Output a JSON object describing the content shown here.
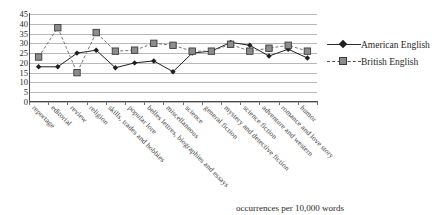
{
  "chart_data": {
    "type": "line",
    "title": "",
    "xlabel": "",
    "ylabel": "",
    "ylim": [
      0,
      45
    ],
    "ytick_values": [
      45,
      40,
      35,
      30,
      25,
      20,
      15,
      10,
      5,
      0
    ],
    "grid": true,
    "legend_position": "right",
    "categories": [
      "reportage",
      "editorial",
      "review",
      "religion",
      "skills, trades and hobbies",
      "popular lore",
      "belles lettres, biographies and essays",
      "miscellaneous",
      "science",
      "general fiction",
      "mystery and detective fiction",
      "science fiction",
      "adventure and western",
      "romance and love story",
      "humor"
    ],
    "series": [
      {
        "name": "American English",
        "marker": "diamond",
        "line": "solid",
        "color": "#1f1f1f",
        "values": [
          18,
          18,
          25,
          26.5,
          17.5,
          20,
          21,
          15.5,
          25,
          26,
          30.5,
          29,
          23.5,
          27,
          22.5
        ]
      },
      {
        "name": "British English",
        "marker": "square",
        "line": "dashed",
        "color": "#8c8c8c",
        "values": [
          23,
          38,
          15,
          35.5,
          26,
          26.5,
          30,
          29,
          26,
          26,
          29.5,
          26,
          27.5,
          29,
          26
        ]
      }
    ]
  },
  "legend": {
    "items": [
      {
        "label": "American English"
      },
      {
        "label": "British English"
      }
    ]
  },
  "caption": {
    "text": "occurrences per 10,000 words"
  }
}
